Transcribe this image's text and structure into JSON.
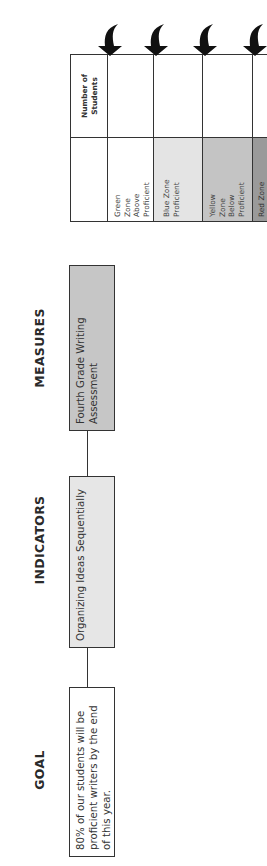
{
  "orientation": "rotated-90-ccw",
  "headers": {
    "goal": "GOAL",
    "indicators": "INDICATORS",
    "measures": "MEASURES"
  },
  "boxes": {
    "goal": "80% of our students will be proficient writers by the end of this year.",
    "indicator": "Organizing Ideas Sequentially",
    "measure": "Fourth Grade Writing Assessment"
  },
  "table": {
    "count_header": "Number of Students",
    "zones": [
      {
        "label": "Green Zone Above Proficient",
        "color": "#ffffff",
        "count": ""
      },
      {
        "label": "Blue Zone Proficient",
        "color": "#e4e4e4",
        "count": ""
      },
      {
        "label": "Yellow Zone Below Proficient",
        "color": "#c4c4c4",
        "count": ""
      },
      {
        "label": "Red Zone",
        "color": "#9a9a9a",
        "count": ""
      }
    ]
  },
  "colors": {
    "indicator_fill": "#e6e6e6",
    "measure_fill": "#c6c6c6",
    "goal_fill": "#ffffff",
    "line": "#333333",
    "arrow": "#111111"
  }
}
